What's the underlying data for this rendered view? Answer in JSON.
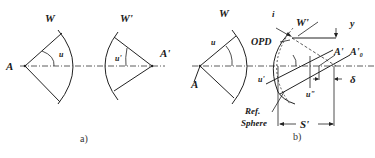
{
  "figure": {
    "panel_a": {
      "caption": "a)",
      "labels": {
        "source_point": "A",
        "image_point": "A'",
        "wavefront_in": "W",
        "wavefront_out": "W'",
        "angle_in": "u",
        "angle_out": "u'"
      }
    },
    "panel_b": {
      "caption": "b)",
      "labels": {
        "source_point": "A",
        "wavefront_in": "W",
        "angle_in": "u",
        "wavefront_out": "W'",
        "incidence": "i",
        "opd": "OPD",
        "height": "y",
        "image_point": "A'",
        "paraxial_image_point": "A'₀",
        "angle_out": "u'",
        "angle_marginal": "u\"",
        "defocus": "δ",
        "ref_sphere_line1": "Ref.",
        "ref_sphere_line2": "Sphere",
        "image_distance": "S'"
      }
    }
  }
}
